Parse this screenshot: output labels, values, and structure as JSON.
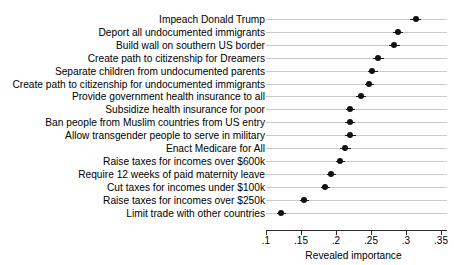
{
  "chart_data": {
    "type": "scatter",
    "title": "",
    "xlabel": "Revealed importance",
    "ylabel": "",
    "xlim": [
      0.0875,
      0.3625
    ],
    "xticks": [
      0.1,
      0.15,
      0.2,
      0.25,
      0.3,
      0.35
    ],
    "xticklabels": [
      ".1",
      ".15",
      ".2",
      ".25",
      ".3",
      ".35"
    ],
    "grid": "horizontal",
    "legend": "none",
    "orientation": "horizontal",
    "categories": [
      "Impeach Donald Trump",
      "Deport all undocumented immigrants",
      "Build wall on southern US border",
      "Create path to citizenship for Dreamers",
      "Separate children from undocumented parents",
      "Create path to citizenship for undocumented immigrants",
      "Provide government health insurance to all",
      "Subsidize health insurance for poor",
      "Ban people from Muslim countries from US entry",
      "Allow transgender people to serve in military",
      "Enact Medicare for All",
      "Raise taxes for incomes over $600k",
      "Require 12 weeks of paid maternity leave",
      "Cut taxes for incomes under $100k",
      "Raise taxes for incomes over $250k",
      "Limit trade with other countries"
    ],
    "values": [
      0.314,
      0.289,
      0.283,
      0.26,
      0.252,
      0.247,
      0.236,
      0.22,
      0.22,
      0.22,
      0.213,
      0.206,
      0.193,
      0.184,
      0.154,
      0.121
    ],
    "ci_low": [
      0.306,
      0.282,
      0.275,
      0.253,
      0.245,
      0.241,
      0.229,
      0.214,
      0.213,
      0.213,
      0.206,
      0.2,
      0.187,
      0.178,
      0.148,
      0.115
    ],
    "ci_high": [
      0.322,
      0.296,
      0.291,
      0.268,
      0.26,
      0.254,
      0.243,
      0.227,
      0.227,
      0.228,
      0.221,
      0.213,
      0.2,
      0.191,
      0.161,
      0.128
    ]
  }
}
